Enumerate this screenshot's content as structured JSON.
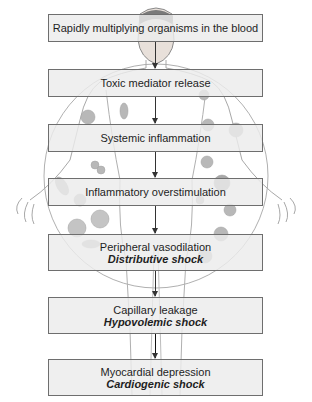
{
  "diagram": {
    "background_illustration": "human-figure-with-blood-cells-circle",
    "colors": {
      "box_fill": "#ebebeb",
      "box_border": "#6e6e6e",
      "text": "#1e1e1e",
      "arrow": "#333333",
      "illustration_line": "#a8a8a8",
      "cells": "#b5b5b5"
    },
    "steps": [
      {
        "label": "Rapidly multiplying organisms in the blood",
        "sub": ""
      },
      {
        "label": "Toxic mediator release",
        "sub": ""
      },
      {
        "label": "Systemic inflammation",
        "sub": ""
      },
      {
        "label": "Inflammatory overstimulation",
        "sub": ""
      },
      {
        "label": "Peripheral vasodilation",
        "sub": "Distributive shock"
      },
      {
        "label": "Capillary leakage",
        "sub": "Hypovolemic shock"
      },
      {
        "label": "Myocardial depression",
        "sub": "Cardiogenic shock"
      }
    ]
  }
}
